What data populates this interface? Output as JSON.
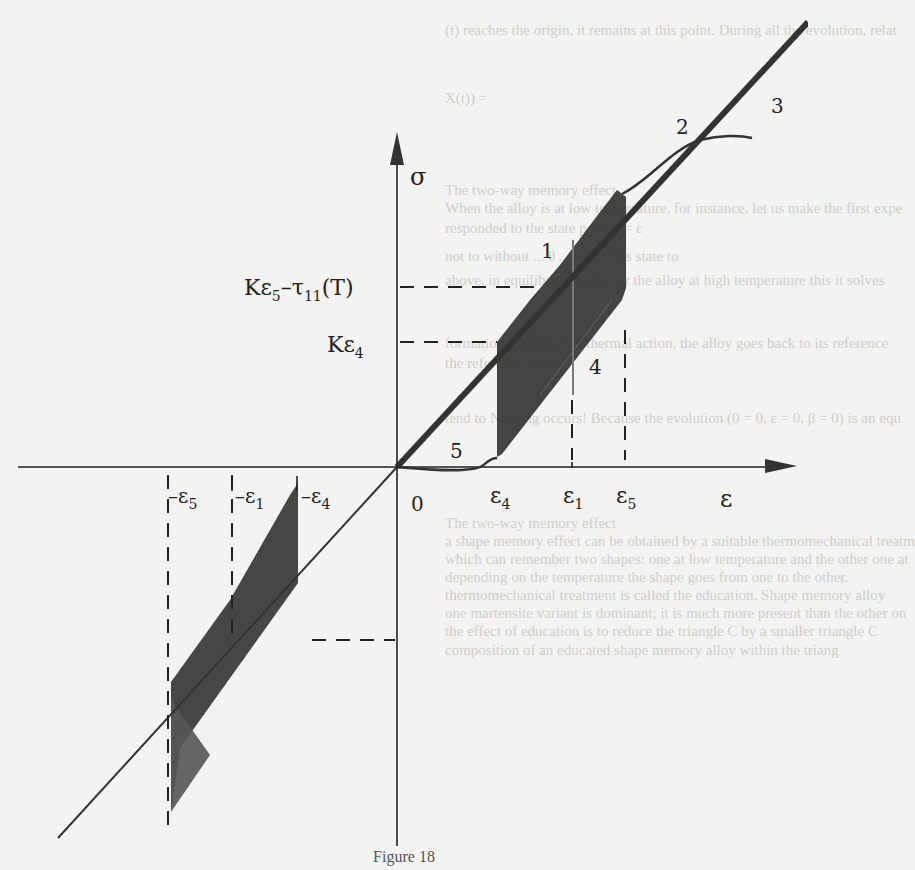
{
  "figure": {
    "caption": "Figure 18",
    "axes": {
      "y_label": "σ",
      "x_label": "ε",
      "origin_label": "0"
    },
    "y_ticks": [
      {
        "label_main": "Kε",
        "label_sub": "5",
        "label_rest": "–τ",
        "label_sub2": "11",
        "label_tail": "(T)"
      },
      {
        "label_main": "Kε",
        "label_sub": "4"
      }
    ],
    "x_ticks_positive": [
      {
        "main": "ε",
        "sub": "4"
      },
      {
        "main": "ε",
        "sub": "1"
      },
      {
        "main": "ε",
        "sub": "5"
      }
    ],
    "x_ticks_negative": [
      {
        "main": "–ε",
        "sub": "5"
      },
      {
        "main": "–ε",
        "sub": "1"
      },
      {
        "main": "–ε",
        "sub": "4"
      }
    ],
    "path_labels": [
      "1",
      "2",
      "3",
      "4",
      "5"
    ],
    "colors": {
      "ink": "#222222",
      "shade": "#3a3a3a",
      "paper": "#f3f3f1",
      "bleed_text": "#c9c9c6"
    }
  },
  "bleed_through_text": [
    "(t) reaches the origin, it remains at this point. During all the evolution, relat",
    "X(t)) =",
    "The two-way memory effect",
    "When the alloy is at low temperature, for instance, let us make the first expe",
    "responded to the state point ε = ε",
    "not to without ... θ ... (ε5). This state to",
    "above, in equilibrium point for the alloy at high temperature this it solves",
    "formation produced by thermal action, the alloy goes back to its reference",
    "the reference shape.",
    "tend to Nothing occurs! Because the evolution (0 = 0, ε = 0, β = 0) is an equ",
    "The two-way memory effect",
    "a shape memory effect can be obtained by a suitable thermomechanical treatm",
    "which can remember two shapes: one at low temperature and the other one at",
    "depending on the temperature the shape goes from one to the other.",
    "thermomechanical treatment is called the education. Shape memory alloy",
    "one martensite variant is dominant; it is much more present than the other on",
    "the effect of education is to reduce the triangle C by a smaller triangle C",
    "composition of an educated shape memory alloy within the triang"
  ]
}
